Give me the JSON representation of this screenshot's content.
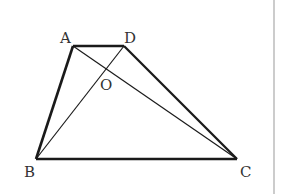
{
  "diagram": {
    "type": "geometry",
    "shape": "trapezoid",
    "vertices": {
      "A": {
        "label": "A",
        "x": 73,
        "y": 46
      },
      "D": {
        "label": "D",
        "x": 124,
        "y": 46
      },
      "B": {
        "label": "B",
        "x": 36,
        "y": 159
      },
      "C": {
        "label": "C",
        "x": 237,
        "y": 159
      }
    },
    "intersection": {
      "label": "O"
    },
    "sides": [
      "AD",
      "DC",
      "CB",
      "BA"
    ],
    "diagonals": [
      "AC",
      "BD"
    ],
    "colors": {
      "stroke": "#1a1a1a",
      "label": "#333333",
      "divider": "#bbbbbb"
    }
  }
}
